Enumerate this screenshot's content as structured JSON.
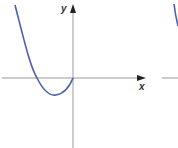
{
  "figure": {
    "x_label": "x",
    "y_label": "y",
    "curve_color": "#4a5fae",
    "axis_color": "#9a9a9a",
    "arrow_color": "#222222"
  }
}
